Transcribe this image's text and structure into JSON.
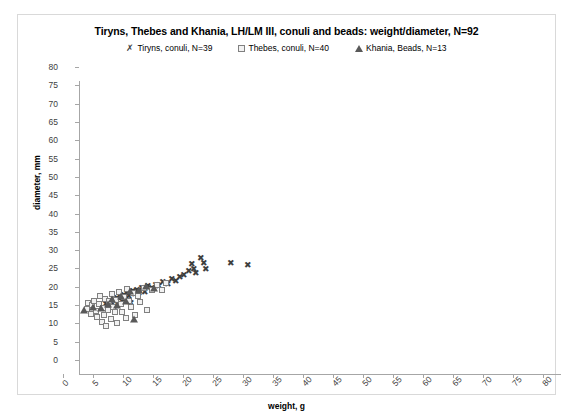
{
  "chart_data": {
    "type": "scatter",
    "title": "Tiryns, Thebes and Khania, LH/LM III, conuli and beads: weight/diameter, N=92",
    "xlabel": "weight, g",
    "ylabel": "diameter, mm",
    "xlim": [
      0,
      80
    ],
    "ylim": [
      0,
      80
    ],
    "xticks": [
      0,
      5,
      10,
      15,
      20,
      25,
      30,
      35,
      40,
      45,
      50,
      55,
      60,
      65,
      70,
      75,
      80
    ],
    "yticks": [
      0,
      5,
      10,
      15,
      20,
      25,
      30,
      35,
      40,
      45,
      50,
      55,
      60,
      65,
      70,
      75,
      80
    ],
    "grid": false,
    "legend_position": "top-center",
    "series": [
      {
        "name": "Tiryns, conuli, N=39",
        "marker": "cross",
        "glyph": "✗",
        "color": "#3f3f3f",
        "points": [
          [
            4.3,
            19.0
          ],
          [
            4.8,
            18.2
          ],
          [
            5.2,
            19.6
          ],
          [
            5.6,
            20.2
          ],
          [
            5.9,
            18.6
          ],
          [
            6.2,
            20.8
          ],
          [
            6.4,
            19.2
          ],
          [
            6.8,
            21.0
          ],
          [
            7.0,
            19.8
          ],
          [
            7.3,
            21.6
          ],
          [
            7.6,
            20.4
          ],
          [
            7.9,
            22.2
          ],
          [
            8.2,
            21.2
          ],
          [
            8.5,
            19.4
          ],
          [
            8.8,
            22.6
          ],
          [
            9.1,
            21.8
          ],
          [
            9.5,
            23.0
          ],
          [
            9.9,
            22.0
          ],
          [
            10.3,
            23.4
          ],
          [
            10.8,
            22.4
          ],
          [
            11.4,
            24.0
          ],
          [
            12.0,
            23.6
          ],
          [
            12.6,
            24.4
          ],
          [
            13.2,
            24.0
          ],
          [
            13.9,
            25.0
          ],
          [
            14.6,
            24.6
          ],
          [
            15.3,
            26.0
          ],
          [
            16.0,
            25.4
          ],
          [
            16.7,
            26.6
          ],
          [
            17.4,
            27.0
          ],
          [
            18.1,
            28.2
          ],
          [
            18.6,
            30.0
          ],
          [
            19.0,
            28.8
          ],
          [
            19.4,
            27.6
          ],
          [
            20.2,
            31.8
          ],
          [
            20.6,
            30.2
          ],
          [
            21.0,
            28.6
          ],
          [
            25.2,
            30.4
          ],
          [
            28.0,
            29.8
          ]
        ]
      },
      {
        "name": "Thebes, conuli, N=40",
        "marker": "square",
        "glyph": "☐",
        "color": "#808080",
        "points": [
          [
            1.1,
            17.8
          ],
          [
            1.4,
            19.4
          ],
          [
            1.8,
            16.4
          ],
          [
            2.0,
            18.8
          ],
          [
            2.3,
            20.0
          ],
          [
            2.6,
            17.2
          ],
          [
            2.9,
            15.6
          ],
          [
            3.1,
            19.0
          ],
          [
            3.4,
            21.2
          ],
          [
            3.6,
            14.2
          ],
          [
            3.8,
            18.0
          ],
          [
            4.0,
            16.0
          ],
          [
            4.2,
            20.6
          ],
          [
            4.4,
            13.2
          ],
          [
            4.6,
            17.6
          ],
          [
            4.9,
            19.8
          ],
          [
            5.1,
            15.0
          ],
          [
            5.3,
            21.8
          ],
          [
            5.5,
            18.4
          ],
          [
            5.8,
            16.8
          ],
          [
            6.0,
            20.2
          ],
          [
            6.2,
            14.0
          ],
          [
            6.5,
            22.4
          ],
          [
            6.8,
            19.2
          ],
          [
            7.0,
            17.0
          ],
          [
            7.3,
            21.0
          ],
          [
            7.6,
            15.4
          ],
          [
            7.9,
            23.2
          ],
          [
            8.2,
            20.0
          ],
          [
            8.5,
            18.2
          ],
          [
            8.9,
            22.0
          ],
          [
            9.2,
            16.2
          ],
          [
            9.6,
            21.4
          ],
          [
            10.0,
            19.6
          ],
          [
            10.6,
            23.6
          ],
          [
            11.2,
            17.4
          ],
          [
            12.0,
            22.8
          ],
          [
            12.8,
            24.2
          ],
          [
            13.6,
            23.0
          ],
          [
            14.4,
            24.8
          ]
        ]
      },
      {
        "name": "Khania, Beads, N=13",
        "marker": "triangle",
        "glyph": "▲",
        "color": "#595959",
        "points": [
          [
            0.6,
            17.6
          ],
          [
            2.2,
            18.4
          ],
          [
            3.5,
            18.0
          ],
          [
            4.6,
            19.2
          ],
          [
            5.4,
            20.6
          ],
          [
            6.2,
            18.8
          ],
          [
            6.9,
            21.4
          ],
          [
            7.6,
            20.0
          ],
          [
            8.3,
            22.6
          ],
          [
            9.0,
            15.0
          ],
          [
            9.8,
            23.0
          ],
          [
            11.0,
            24.0
          ],
          [
            12.4,
            23.4
          ]
        ]
      }
    ]
  }
}
